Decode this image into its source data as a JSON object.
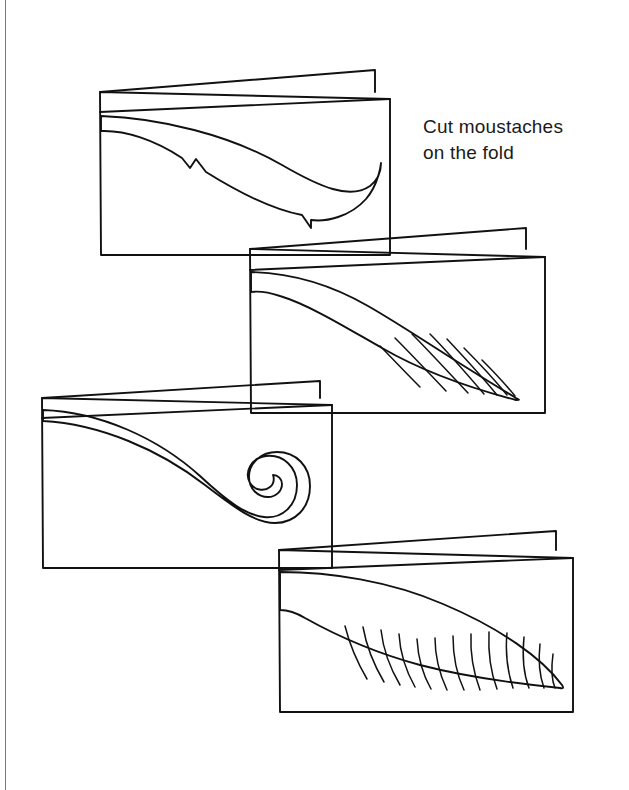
{
  "page": {
    "title": "Cut moustaches on the fold",
    "background_color": "#ffffff",
    "ink_color": "#111111",
    "border_color": "#7a7a7a",
    "width": 629,
    "height": 790
  },
  "instruction": {
    "line1": "Cut moustaches",
    "line2": "on the fold",
    "full_text": "Cut moustaches\non the fold"
  },
  "cards": [
    {
      "id": "card-1",
      "label": "Folded card 1 with swooping tapered moustache",
      "moustache_style": "swooping-tapered",
      "has_hatching": false,
      "has_curl": false,
      "front_panel": {
        "x": 100,
        "y": 92,
        "w": 290,
        "h": 163
      },
      "back_panel_top_right": {
        "x": 375,
        "y": 70
      }
    },
    {
      "id": "card-2",
      "label": "Folded card 2 with bushy hatched moustache",
      "moustache_style": "bushy-hatched",
      "has_hatching": true,
      "hatch_line_count": 7,
      "has_curl": false,
      "front_panel": {
        "x": 250,
        "y": 249,
        "w": 295,
        "h": 164
      },
      "back_panel_top_right": {
        "x": 526,
        "y": 228
      }
    },
    {
      "id": "card-3",
      "label": "Folded card 3 with handlebar moustache and spiral curl",
      "moustache_style": "handlebar-curl",
      "has_hatching": false,
      "has_curl": true,
      "front_panel": {
        "x": 42,
        "y": 398,
        "w": 290,
        "h": 170
      },
      "back_panel_top_right": {
        "x": 320,
        "y": 381
      }
    },
    {
      "id": "card-4",
      "label": "Folded card 4 with broad hatched moustache",
      "moustache_style": "broad-hatched",
      "has_hatching": true,
      "hatch_line_count": 13,
      "has_curl": false,
      "front_panel": {
        "x": 279,
        "y": 550,
        "w": 294,
        "h": 162
      },
      "back_panel_top_right": {
        "x": 556,
        "y": 531
      }
    }
  ]
}
